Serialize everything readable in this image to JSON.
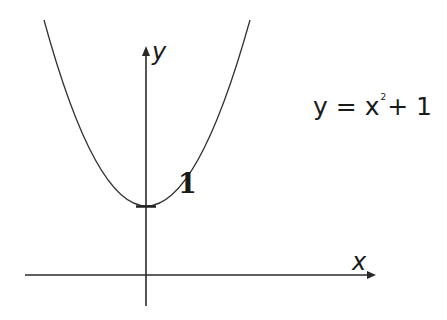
{
  "diagram": {
    "axes": {
      "x_label": "x",
      "y_label": "y"
    },
    "curve": {
      "type": "parabola",
      "equation": "y = x^2 + 1",
      "vertex_label": "1"
    },
    "equation_text": {
      "lhs": "y",
      "equals": "=",
      "base": "x",
      "exponent": "2",
      "plus": "+",
      "constant": "1"
    },
    "colors": {
      "line": "#1a1a1a",
      "background": "#ffffff"
    }
  }
}
